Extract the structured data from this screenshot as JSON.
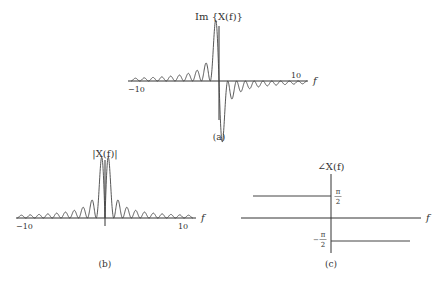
{
  "figure": {
    "panel_a": {
      "ylabel": "Im {X(f)}",
      "xlabel": "f",
      "tick_left": "−10",
      "tick_right": "10",
      "caption": "(a)"
    },
    "panel_b": {
      "ylabel": "|X(f)|",
      "xlabel": "f",
      "tick_left": "−10",
      "tick_right": "10",
      "caption": "(b)"
    },
    "panel_c": {
      "ylabel": "∠X(f)",
      "xlabel": "f",
      "tick_upper_num": "π",
      "tick_upper_den": "2",
      "tick_lower_sign": "−",
      "tick_lower_num": "π",
      "tick_lower_den": "2",
      "caption": "(c)"
    }
  },
  "chart_data": [
    {
      "type": "line",
      "title": "(a)",
      "ylabel": "Im {X(f)}",
      "xlabel": "f",
      "xlim": [
        -10,
        10
      ],
      "description": "Odd function: positive oscillating lobes for f<0 growing toward f=0, large positive peak just left of 0, large negative trough just right of 0, decaying negative lobes for f>0",
      "grid": false
    },
    {
      "type": "line",
      "title": "(b)",
      "ylabel": "|X(f)|",
      "xlabel": "f",
      "xlim": [
        -10,
        10
      ],
      "description": "Even magnitude spectrum: two tall peaks adjacent to f=0 with a dip at 0, decaying side lobes on both sides",
      "grid": false
    },
    {
      "type": "line",
      "title": "(c)",
      "ylabel": "∠X(f)",
      "xlabel": "f",
      "description": "Phase: +π/2 for f<0, −π/2 for f>0",
      "x": [
        -10,
        0,
        0,
        10
      ],
      "y": [
        1.5708,
        1.5708,
        -1.5708,
        -1.5708
      ],
      "yticks": [
        "π/2",
        "−π/2"
      ],
      "grid": false
    }
  ]
}
